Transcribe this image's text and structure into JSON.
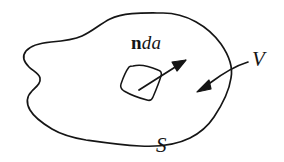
{
  "figure": {
    "kind": "hand-drawn mathematical diagram",
    "background_color": "#ffffff",
    "ink_color": "#151515",
    "stroke_width": 1.6
  },
  "labels": {
    "normal_area_vector": {
      "vector_part": "n",
      "scalar_part": "da",
      "full_text": "n da",
      "meaning": "outward unit normal times area element"
    },
    "volume": {
      "text": "V",
      "meaning": "enclosed volume"
    },
    "surface": {
      "text": "S",
      "meaning": "bounding closed surface"
    }
  },
  "elements": {
    "blob_outline_name": "closed-surface-outline",
    "patch_name": "area-element-patch",
    "normal_arrow_name": "normal-vector-arrow",
    "volume_leader_name": "volume-leader-arrow"
  }
}
